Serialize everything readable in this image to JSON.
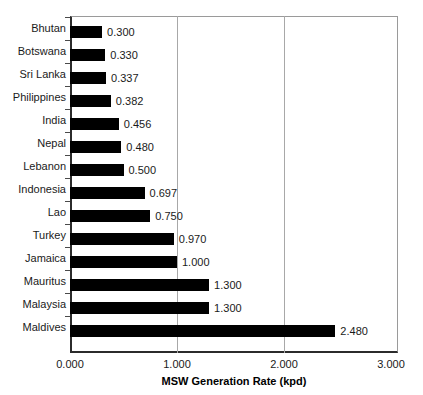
{
  "chart_data": {
    "type": "bar",
    "orientation": "horizontal",
    "title": "",
    "xlabel": "MSW Generation Rate (kpd)",
    "ylabel": "",
    "xlim": [
      0,
      3
    ],
    "xticks": [
      "0.000",
      "1.000",
      "2.000",
      "3.000"
    ],
    "xtick_values": [
      0,
      1,
      2,
      3
    ],
    "grid": "vertical",
    "legend": null,
    "bar_color": "#000000",
    "categories": [
      "Bhutan",
      "Botswana",
      "Sri Lanka",
      "Philippines",
      "India",
      "Nepal",
      "Lebanon",
      "Indonesia",
      "Lao",
      "Turkey",
      "Jamaica",
      "Mauritus",
      "Malaysia",
      "Maldives"
    ],
    "values": [
      0.3,
      0.33,
      0.337,
      0.382,
      0.456,
      0.48,
      0.5,
      0.697,
      0.75,
      0.97,
      1.0,
      1.3,
      1.3,
      2.48
    ],
    "data_labels": [
      "0.300",
      "0.330",
      "0.337",
      "0.382",
      "0.456",
      "0.480",
      "0.500",
      "0.697",
      "0.750",
      "0.970",
      "1.000",
      "1.300",
      "1.300",
      "2.480"
    ]
  }
}
